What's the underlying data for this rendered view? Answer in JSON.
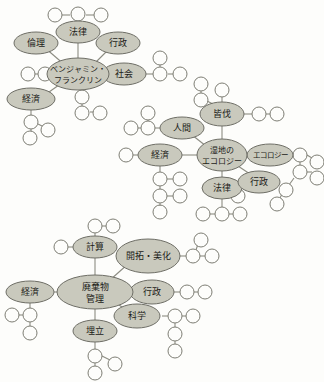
{
  "diagram": {
    "background_color": "#fdfdfb",
    "node_fill_color": "#c9c9bd",
    "node_stroke_color": "#6e6e66",
    "leaf_fill_color": "#fdfdfb",
    "edge_color": "#8c8c82"
  },
  "clusters": [
    {
      "id": "benjamin-franklin",
      "center_label_line1": "ベンジャミン・",
      "center_label_line2": "フランクリン",
      "branches": [
        {
          "label": "法律"
        },
        {
          "label": "倫理"
        },
        {
          "label": "行政"
        },
        {
          "label": "社会"
        },
        {
          "label": "経済"
        }
      ]
    },
    {
      "id": "wetland-ecology",
      "center_label_line1": "湿地の",
      "center_label_line2": "エコロジー",
      "branches": [
        {
          "label": "皆伐"
        },
        {
          "label": "人間"
        },
        {
          "label": "経済"
        },
        {
          "label": "エコロジー"
        },
        {
          "label": "法律"
        },
        {
          "label": "行政"
        }
      ]
    },
    {
      "id": "waste-management",
      "center_label_line1": "廃棄物",
      "center_label_line2": "管理",
      "branches": [
        {
          "label": "計算"
        },
        {
          "label": "開拓・美化"
        },
        {
          "label": "経済"
        },
        {
          "label": "行政"
        },
        {
          "label": "科学"
        },
        {
          "label": "埋立"
        }
      ]
    }
  ]
}
